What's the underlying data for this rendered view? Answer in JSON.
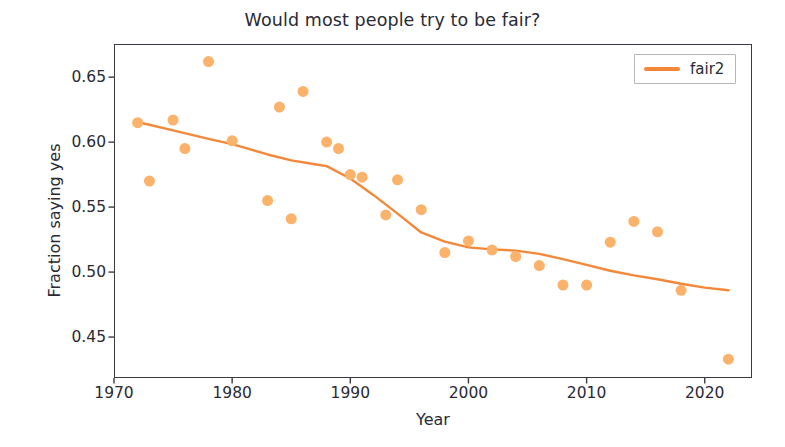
{
  "chart_data": {
    "type": "scatter",
    "title": "Would most people try to be fair?",
    "xlabel": "Year",
    "ylabel": "Fraction saying yes",
    "xlim": [
      1970.0,
      2024.0
    ],
    "ylim": [
      0.4185,
      0.6755
    ],
    "grid": false,
    "legend_position": "upper right",
    "xticks": [
      1970,
      1980,
      1990,
      2000,
      2010,
      2020
    ],
    "xtick_labels": [
      "1970",
      "1980",
      "1990",
      "2000",
      "2010",
      "2020"
    ],
    "yticks": [
      0.45,
      0.5,
      0.55,
      0.6,
      0.65
    ],
    "ytick_labels": [
      "0.45",
      "0.50",
      "0.55",
      "0.60",
      "0.65"
    ],
    "colors": {
      "marker": "#fbb26a",
      "line": "#f3883a",
      "axes": "#3a3a44",
      "text": "#2a2a33"
    },
    "series": [
      {
        "name": "fair",
        "kind": "scatter",
        "marker": "circle",
        "marker_size": 11,
        "color": "#fbb26a",
        "x": [
          1972,
          1973,
          1975,
          1976,
          1978,
          1980,
          1983,
          1984,
          1985,
          1986,
          1988,
          1989,
          1990,
          1991,
          1993,
          1994,
          1996,
          1998,
          2000,
          2002,
          2004,
          2006,
          2008,
          2010,
          2012,
          2014,
          2016,
          2018,
          2022
        ],
        "y": [
          0.615,
          0.57,
          0.617,
          0.595,
          0.662,
          0.601,
          0.555,
          0.627,
          0.541,
          0.639,
          0.6,
          0.595,
          0.575,
          0.573,
          0.544,
          0.571,
          0.548,
          0.515,
          0.524,
          0.517,
          0.512,
          0.505,
          0.49,
          0.49,
          0.523,
          0.539,
          0.531,
          0.486,
          0.433
        ]
      },
      {
        "name": "fair2",
        "kind": "line",
        "color": "#f3883a",
        "linewidth": 2.4,
        "x": [
          1972,
          1975,
          1978,
          1980,
          1983,
          1985,
          1987,
          1988,
          1990,
          1992,
          1994,
          1996,
          1998,
          2000,
          2002,
          2004,
          2006,
          2008,
          2010,
          2012,
          2014,
          2016,
          2018,
          2020,
          2022
        ],
        "y": [
          0.6155,
          0.609,
          0.6025,
          0.5985,
          0.5905,
          0.586,
          0.583,
          0.5815,
          0.572,
          0.559,
          0.545,
          0.5305,
          0.5235,
          0.519,
          0.5175,
          0.5165,
          0.514,
          0.51,
          0.5055,
          0.501,
          0.4975,
          0.4945,
          0.491,
          0.488,
          0.486
        ]
      }
    ],
    "legend_entries": [
      {
        "label": "fair2",
        "color": "#f3883a",
        "swatch": "line"
      }
    ]
  }
}
